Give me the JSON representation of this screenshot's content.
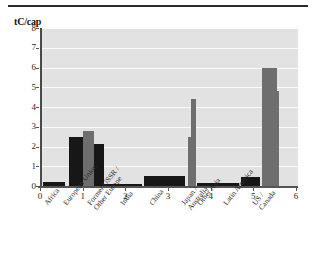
{
  "figure": {
    "y_axis_title": "tC/cap",
    "has_top_rule": true,
    "plot_bg_color": "#e2e2e2",
    "gridline_color": "#fbfbfb",
    "axis_color": "#555555"
  },
  "chart_data": {
    "type": "bar",
    "title": "",
    "xlabel": "",
    "ylabel": "tC/cap",
    "ylim": [
      0,
      8
    ],
    "yticks": [
      0,
      1,
      2,
      3,
      4,
      5,
      6,
      7,
      8
    ],
    "xlim": [
      0,
      6
    ],
    "xticks": [
      0,
      1,
      2,
      3,
      4,
      5,
      6
    ],
    "grid": true,
    "legend": "none",
    "categories": [
      "Africa",
      "European Union",
      "Former USSR / Other Europe",
      "India",
      "China",
      "Japan / Australia",
      "Other Asia",
      "Latin America",
      "US / Canada"
    ],
    "category_lines": [
      [
        "Africa"
      ],
      [
        "European Union"
      ],
      [
        "Former USSR /",
        "Other Europe"
      ],
      [
        "India"
      ],
      [
        "China"
      ],
      [
        "Japan /",
        "Australia"
      ],
      [
        "Other Asia"
      ],
      [
        "Latin America"
      ],
      [
        "US /",
        "Canada"
      ]
    ],
    "series": [
      {
        "name": "dark",
        "color": "#171717",
        "values": [
          0.2,
          2.5,
          2.15,
          0.1,
          0.5,
          0.15,
          0.15,
          0.45,
          4.8
        ]
      },
      {
        "name": "light",
        "color": "#6e6e6e",
        "values": [
          0.2,
          2.5,
          2.8,
          0.1,
          0.5,
          4.4,
          0.15,
          0.45,
          6.0
        ]
      }
    ],
    "bars": [
      {
        "category": "Africa",
        "value": 0.2,
        "shade": "dark",
        "x_left": 0.02,
        "x_right": 0.55
      },
      {
        "category": "European Union",
        "value": 2.5,
        "shade": "dark",
        "x_left": 0.62,
        "x_right": 0.95
      },
      {
        "category": "Former USSR / Other Europe",
        "value": 2.8,
        "shade": "light",
        "x_left": 0.95,
        "x_right": 1.22
      },
      {
        "category": "Former USSR / Other Europe",
        "value": 2.15,
        "shade": "dark",
        "x_left": 1.22,
        "x_right": 1.45
      },
      {
        "category": "India",
        "value": 0.1,
        "shade": "dark",
        "x_left": 1.45,
        "x_right": 2.35
      },
      {
        "category": "China",
        "value": 0.5,
        "shade": "dark",
        "x_left": 2.38,
        "x_right": 3.35
      },
      {
        "category": "Japan / Australia",
        "value": 2.5,
        "shade": "light",
        "x_left": 3.43,
        "x_right": 3.56
      },
      {
        "category": "Japan / Australia",
        "value": 4.4,
        "shade": "light",
        "x_left": 3.5,
        "x_right": 3.6
      },
      {
        "category": "Other Asia",
        "value": 0.15,
        "shade": "dark",
        "x_left": 3.62,
        "x_right": 4.62
      },
      {
        "category": "Latin America",
        "value": 0.45,
        "shade": "dark",
        "x_left": 4.66,
        "x_right": 5.12
      },
      {
        "category": "US / Canada",
        "value": 6.0,
        "shade": "light",
        "x_left": 5.16,
        "x_right": 5.5
      },
      {
        "category": "US / Canada",
        "value": 4.8,
        "shade": "light",
        "x_left": 5.5,
        "x_right": 5.56
      }
    ]
  }
}
